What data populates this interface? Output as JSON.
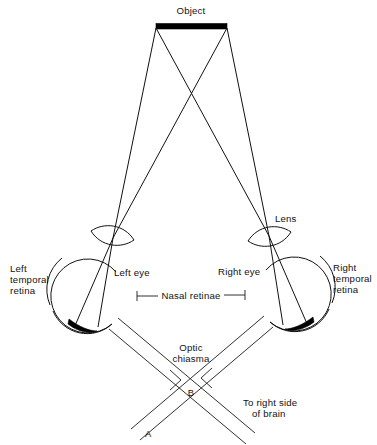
{
  "figure": {
    "type": "diagram",
    "background_color": "#ffffff",
    "line_color": "#111111",
    "image_fill_color": "#000000"
  },
  "labels": {
    "object": "Object",
    "lens": "Lens",
    "left_eye": "Left eye",
    "right_eye": "Right eye",
    "left_temporal_retina_line1": "Left",
    "left_temporal_retina_line2": "temporal",
    "left_temporal_retina_line3": "retina",
    "right_temporal_retina_line1": "Right",
    "right_temporal_retina_line2": "temporal",
    "right_temporal_retina_line3": "retina",
    "nasal_retinae": "Nasal retinae",
    "optic_chiasma_line1": "Optic",
    "optic_chiasma_line2": "chiasma",
    "to_brain_line1": "To right side",
    "to_brain_line2": "of brain",
    "point_a": "A",
    "point_b": "B"
  },
  "geometry": {
    "object_bar": {
      "x1": 156,
      "y1": 26,
      "x2": 227,
      "y2": 26,
      "thickness": 5
    },
    "crossing_point": {
      "x": 191,
      "y": 96
    },
    "left_lens_center": {
      "x": 113,
      "y": 238
    },
    "right_lens_center": {
      "x": 269,
      "y": 236
    },
    "left_eye_center": {
      "x": 90,
      "y": 297
    },
    "right_eye_center": {
      "x": 292,
      "y": 295
    },
    "eye_radius": 36,
    "chiasma_point": {
      "x": 190,
      "y": 385
    },
    "point_a_pos": {
      "x": 146,
      "y": 433
    },
    "point_b_pos": {
      "x": 191,
      "y": 395
    }
  }
}
